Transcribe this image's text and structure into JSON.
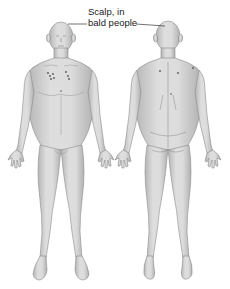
{
  "figure": {
    "label": {
      "line1": "Scalp, in",
      "line2": "bald people"
    },
    "views": [
      {
        "id": "anterior",
        "name": "Front view of body"
      },
      {
        "id": "posterior",
        "name": "Back view of body"
      }
    ],
    "colors": {
      "skin": "#d4d4d4",
      "skin_shade": "#a9a9a9",
      "outline": "#8c8c8c",
      "marks": "#555555",
      "text": "#222222",
      "background": "#ffffff"
    }
  }
}
